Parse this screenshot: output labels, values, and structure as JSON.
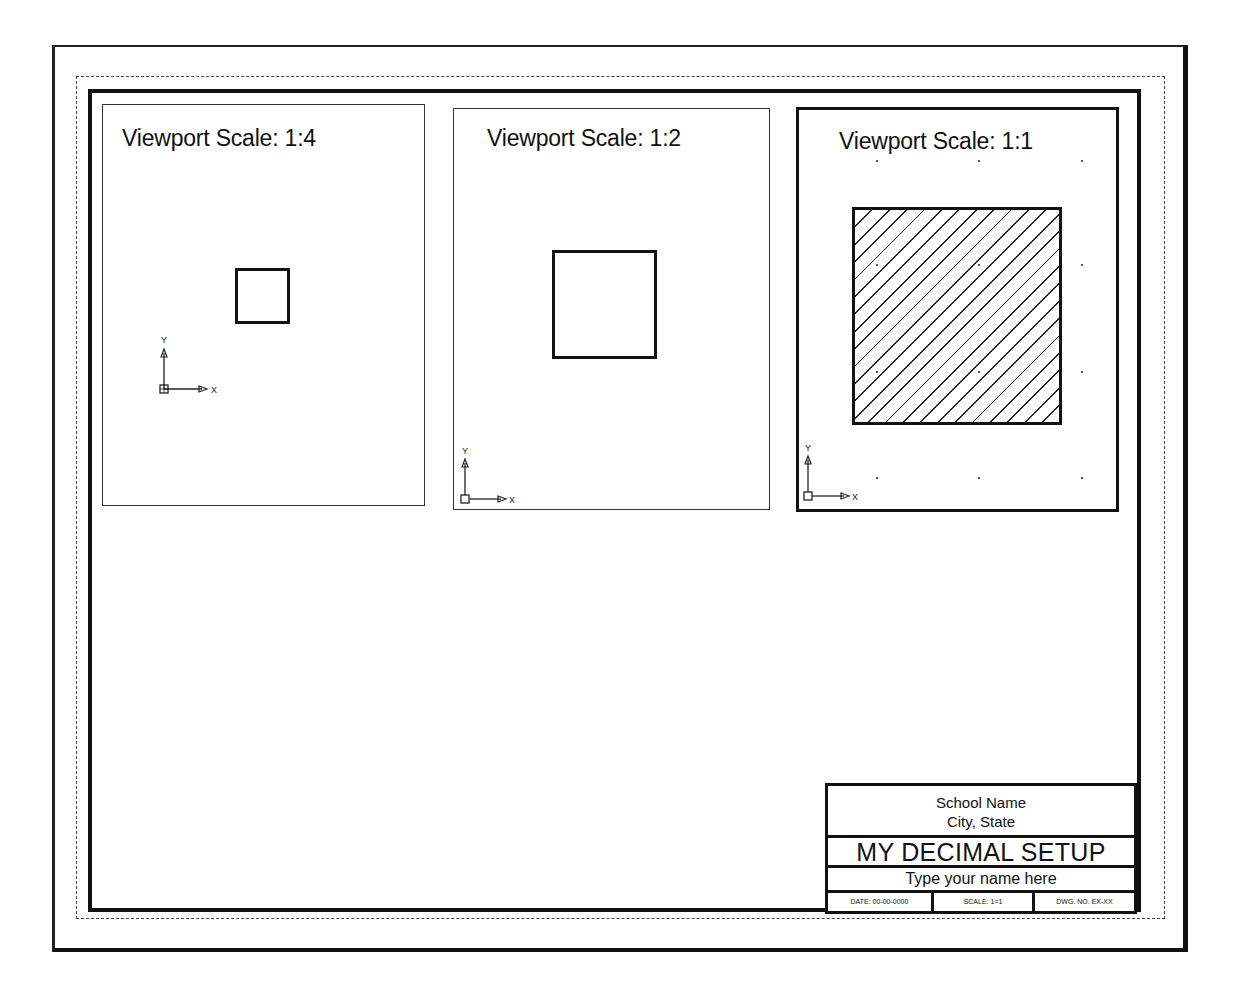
{
  "sheet": {
    "layout": "paper-space drawing sheet",
    "colors": {
      "line": "#111111",
      "background": "#ffffff",
      "dashed_margin": "#444444"
    }
  },
  "viewports": [
    {
      "title": "Viewport Scale: 1:4",
      "scale": "1:4",
      "object": "square",
      "hatched": false,
      "active": false,
      "ucs": {
        "x_label": "X",
        "y_label": "Y"
      }
    },
    {
      "title": "Viewport Scale: 1:2",
      "scale": "1:2",
      "object": "square",
      "hatched": false,
      "active": false,
      "ucs": {
        "x_label": "X",
        "y_label": "Y"
      }
    },
    {
      "title": "Viewport Scale: 1:1",
      "scale": "1:1",
      "object": "square",
      "hatched": true,
      "active": true,
      "ucs": {
        "x_label": "X",
        "y_label": "Y"
      }
    }
  ],
  "title_block": {
    "school_name": "School Name",
    "city_state": "City, State",
    "drawing_title": "MY DECIMAL SETUP",
    "student_name": "Type your name here",
    "date": "DATE: 00-00-0000",
    "scale": "SCALE: 1=1",
    "dwg_no": "DWG. NO. EX-XX"
  }
}
